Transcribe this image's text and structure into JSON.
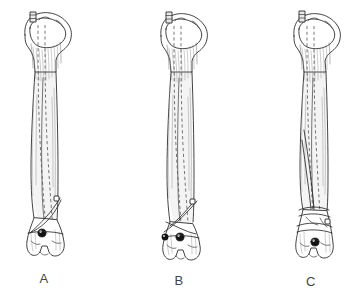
{
  "figure": {
    "background_color": "#ffffff",
    "ink_color": "#2e2e2e",
    "label_color": "#444444",
    "width": 362,
    "height": 299,
    "style": "anatomical line drawing, pen and ink hatching"
  },
  "panels": [
    {
      "id": "a",
      "label": "A",
      "bone": "tibia",
      "view": "anterior",
      "implant": "intramedullary nail",
      "nail_entry": "proximal tibia, nail end protruding",
      "fracture_pattern": "distal oblique fracture",
      "distal_locking_screws": 1,
      "proximal_locking_screws": 0,
      "center_x": 44,
      "label_x": 32,
      "label_y": 271
    },
    {
      "id": "b",
      "label": "B",
      "bone": "tibia",
      "view": "anterior",
      "implant": "intramedullary nail",
      "nail_entry": "proximal tibia, nail end protruding",
      "fracture_pattern": "distal oblique fracture with butterfly fragment",
      "distal_locking_screws": 2,
      "proximal_locking_screws": 0,
      "center_x": 180,
      "label_x": 167,
      "label_y": 273
    },
    {
      "id": "c",
      "label": "C",
      "bone": "tibia",
      "view": "anterior",
      "implant": "intramedullary nail",
      "nail_entry": "proximal tibia, nail end protruding",
      "fracture_pattern": "segmental comminuted distal fracture",
      "distal_locking_screws": 1,
      "proximal_locking_screws": 0,
      "center_x": 314,
      "label_x": 299,
      "label_y": 274
    }
  ],
  "legend": {
    "dashed_lines": "intramedullary nail seen through bone",
    "black_circles": "interlocking screw heads",
    "solid_transverse_lines": "fracture lines"
  }
}
